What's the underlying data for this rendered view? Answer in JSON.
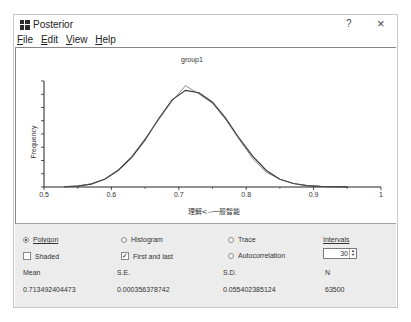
{
  "window": {
    "title": "Posterior",
    "help_label": "?",
    "close_label": "×",
    "icon": "app-grid-icon"
  },
  "menu": {
    "items": [
      {
        "label": "File",
        "mnemonic": "F"
      },
      {
        "label": "Edit",
        "mnemonic": "E"
      },
      {
        "label": "View",
        "mnemonic": "V"
      },
      {
        "label": "Help",
        "mnemonic": "H"
      }
    ]
  },
  "controls": {
    "polygon_label": "Polygon",
    "polygon_selected": true,
    "histogram_label": "Histogram",
    "histogram_selected": false,
    "trace_label": "Trace",
    "trace_selected": false,
    "autocorrelation_label": "Autocorrelation",
    "autocorrelation_selected": false,
    "shaded_label": "Shaded",
    "shaded_checked": false,
    "first_last_label": "First and last",
    "first_last_checked": true,
    "intervals_label": "Intervals",
    "intervals_value": "30"
  },
  "stats": {
    "mean_label": "Mean",
    "mean_value": "0.713492404473",
    "se_label": "S.E.",
    "se_value": "0.000356378742",
    "sd_label": "S.D.",
    "sd_value": "0.055402385124",
    "n_label": "N",
    "n_value": "63500"
  },
  "chart_data": {
    "type": "line",
    "title": "group1",
    "xlabel": "理解<--一般智能",
    "ylabel": "Frequency",
    "xlim": [
      0.5,
      1.0
    ],
    "x_ticks": [
      "0.5",
      "0.6",
      "0.7",
      "0.8",
      "0.9",
      "1"
    ],
    "grid": false,
    "legend": null,
    "series": [
      {
        "name": "Polygon (all)",
        "x": [
          0.53,
          0.55,
          0.57,
          0.59,
          0.61,
          0.63,
          0.65,
          0.67,
          0.69,
          0.71,
          0.73,
          0.75,
          0.77,
          0.79,
          0.81,
          0.83,
          0.85,
          0.87,
          0.89,
          0.91,
          0.93,
          0.95
        ],
        "y": [
          0.2,
          0.8,
          2.5,
          6.5,
          14,
          25,
          40,
          58,
          74,
          82,
          80,
          72,
          58,
          41,
          26,
          14,
          6.5,
          3,
          1.2,
          0.5,
          0.2,
          0.05
        ]
      },
      {
        "name": "Polygon (first and last)",
        "x": [
          0.53,
          0.55,
          0.57,
          0.59,
          0.61,
          0.63,
          0.65,
          0.67,
          0.69,
          0.71,
          0.73,
          0.75,
          0.77,
          0.79,
          0.81,
          0.83,
          0.85,
          0.87,
          0.89,
          0.91,
          0.93,
          0.95
        ],
        "y": [
          0.2,
          0.9,
          2.7,
          6.8,
          14.5,
          26,
          41,
          57,
          73,
          86,
          79,
          71,
          57,
          40,
          24,
          12.5,
          6.5,
          3,
          1.2,
          0.5,
          0.2,
          0.05
        ]
      }
    ]
  }
}
